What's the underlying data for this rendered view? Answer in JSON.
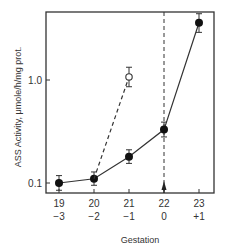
{
  "chart_data": {
    "type": "line",
    "title": "",
    "xlabel": "Gestation",
    "ylabel": "ASS Activity, μmole/h/mg prot.",
    "yscale": "log",
    "ylim": [
      0.085,
      4.5
    ],
    "xlim": [
      18.6,
      23.45
    ],
    "grid": false,
    "x_tick_labels": [
      "19",
      "20",
      "21",
      "22",
      "23"
    ],
    "x_tick_labels_secondary": [
      "−3",
      "−2",
      "−1",
      "0",
      "+1"
    ],
    "y_tick_labels": [
      "0.1",
      "1.0"
    ],
    "series": [
      {
        "name": "closed circles (solid line)",
        "marker": "filled-circle",
        "line": "solid",
        "x": [
          19,
          20,
          21,
          22,
          23
        ],
        "y": [
          0.1,
          0.11,
          0.18,
          0.33,
          3.6
        ],
        "error_low": [
          0.085,
          0.095,
          0.155,
          0.28,
          2.9
        ],
        "error_high": [
          0.118,
          0.128,
          0.21,
          0.39,
          4.4
        ]
      },
      {
        "name": "open circle (dashed line)",
        "marker": "open-circle",
        "line": "dashed",
        "x": [
          20,
          21
        ],
        "y": [
          0.11,
          1.07
        ],
        "error_low": [
          null,
          0.86
        ],
        "error_high": [
          null,
          1.33
        ]
      }
    ],
    "annotations": [
      {
        "type": "vertical-dashed-line",
        "x": 22,
        "label": ""
      },
      {
        "type": "arrow-up",
        "x": 22,
        "label": ""
      }
    ]
  }
}
